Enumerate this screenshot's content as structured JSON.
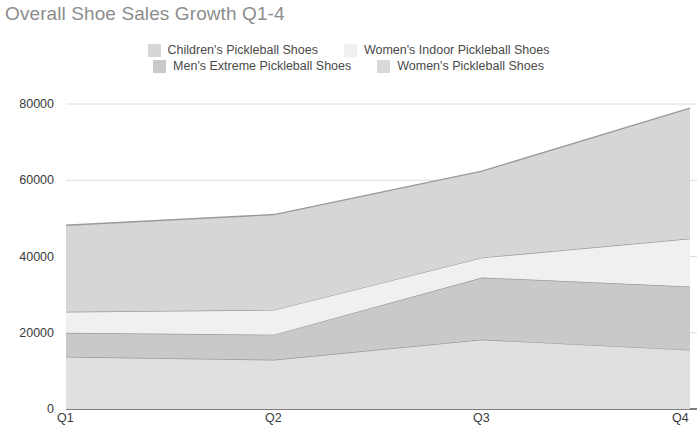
{
  "chart_data": {
    "type": "area",
    "stacked": true,
    "title": "Overall Shoe Sales Growth Q1-4",
    "xlabel": "",
    "ylabel": "",
    "categories": [
      "Q1",
      "Q2",
      "Q3",
      "Q4"
    ],
    "ylim": [
      0,
      80000
    ],
    "xlim": [
      "Q1",
      "Q4"
    ],
    "y_ticks": [
      "0",
      "20000",
      "40000",
      "60000",
      "80000"
    ],
    "y_tick_values": [
      0,
      20000,
      40000,
      60000,
      80000
    ],
    "grid": true,
    "grid_axis": "y",
    "legend_position": "top-center",
    "series": [
      {
        "name": "Women's Pickleball Shoes",
        "color": "#e0e0e0",
        "values": [
          13700,
          12900,
          18200,
          15500
        ]
      },
      {
        "name": "Men's Extreme Pickleball Shoes",
        "color": "#c9c9c9",
        "values": [
          6300,
          6600,
          16300,
          16600
        ]
      },
      {
        "name": "Women's Indoor Pickleball Shoes",
        "color": "#f0f0f0",
        "values": [
          5500,
          6500,
          5200,
          12600
        ]
      },
      {
        "name": "Children's Pickleball Shoes",
        "color": "#d6d6d6",
        "values": [
          22700,
          25000,
          22700,
          34200
        ]
      }
    ],
    "cumulative_totals": [
      48200,
      51000,
      62400,
      68900
    ]
  },
  "chart": {
    "title": "Overall Shoe Sales Growth Q1-4",
    "title_color": "#8d8d8d",
    "background": "#ffffff",
    "line_color": "#9a9a9a",
    "grid_color": "#dcdcdc",
    "axis_color": "#555555"
  },
  "legend": {
    "rows": [
      [
        {
          "label": "Children's Pickleball Shoes",
          "color": "#d6d6d6",
          "swatch": "legend-swatch-children"
        },
        {
          "label": "Women's Indoor Pickleball Shoes",
          "color": "#f0f0f0",
          "swatch": "legend-swatch-womens-indoor"
        }
      ],
      [
        {
          "label": "Men's Extreme Pickleball Shoes",
          "color": "#c9c9c9",
          "swatch": "legend-swatch-mens-extreme"
        },
        {
          "label": "Women's Pickleball Shoes",
          "color": "#d9d9d9",
          "swatch": "legend-swatch-womens"
        }
      ]
    ]
  },
  "axes": {
    "y_labels": [
      "80000",
      "60000",
      "40000",
      "20000",
      "0"
    ],
    "x_labels": [
      "Q1",
      "Q2",
      "Q3",
      "Q4"
    ]
  }
}
